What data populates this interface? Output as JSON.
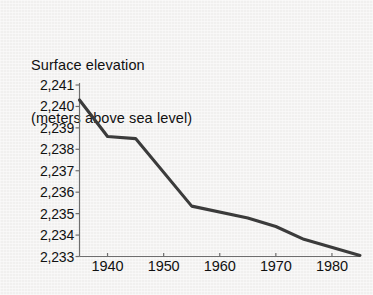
{
  "chart_data": {
    "type": "line",
    "title": "Surface elevation\n(meters above sea level)",
    "title_lines": [
      "Surface elevation",
      "(meters above sea level)"
    ],
    "xlabel": "",
    "ylabel": "Surface elevation (meters above sea level)",
    "xlim": [
      1935,
      1985
    ],
    "ylim": [
      2233,
      2241
    ],
    "grid": false,
    "legend": null,
    "line_color": "#3b3b3b",
    "axis_color": "#6e6e6e",
    "background_color": "#f1f0ef",
    "x_ticks": [
      1940,
      1950,
      1960,
      1970,
      1980
    ],
    "x_tick_labels": [
      "1940",
      "1950",
      "1960",
      "1970",
      "1980"
    ],
    "y_ticks": [
      2233,
      2234,
      2235,
      2236,
      2237,
      2238,
      2239,
      2240,
      2241
    ],
    "y_tick_labels": [
      "2,233",
      "2,234",
      "2,235",
      "2,236",
      "2,237",
      "2,238",
      "2,239",
      "2,240",
      "2,241"
    ],
    "x": [
      1935,
      1940,
      1945,
      1955,
      1965,
      1970,
      1975,
      1985
    ],
    "values": [
      2240.3,
      2238.6,
      2238.5,
      2235.35,
      2234.8,
      2234.4,
      2233.8,
      2233.05
    ],
    "series": [
      {
        "name": "Surface elevation",
        "x": [
          1935,
          1940,
          1945,
          1955,
          1965,
          1970,
          1975,
          1985
        ],
        "values": [
          2240.3,
          2238.6,
          2238.5,
          2235.35,
          2234.8,
          2234.4,
          2233.8,
          2233.05
        ]
      }
    ],
    "annotations": []
  }
}
